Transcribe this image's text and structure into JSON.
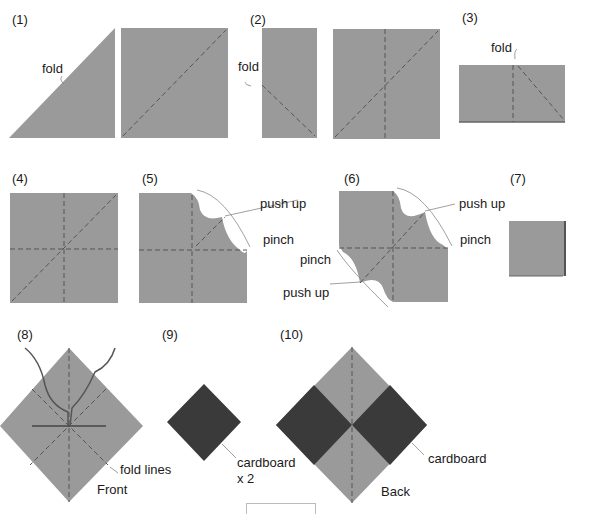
{
  "colors": {
    "paper": "#9a9a9a",
    "cardboard": "#3a3a3a",
    "fold_line": "#555555",
    "leader": "#888888",
    "text": "#1a1a1a"
  },
  "steps": [
    {
      "number": "(1)",
      "labels": [
        "fold"
      ]
    },
    {
      "number": "(2)",
      "labels": [
        "fold"
      ]
    },
    {
      "number": "(3)",
      "labels": [
        "fold"
      ]
    },
    {
      "number": "(4)",
      "labels": []
    },
    {
      "number": "(5)",
      "labels": [
        "push up",
        "pinch"
      ]
    },
    {
      "number": "(6)",
      "labels": [
        "push up",
        "pinch",
        "pinch",
        "push up"
      ]
    },
    {
      "number": "(7)",
      "labels": []
    },
    {
      "number": "(8)",
      "labels": [
        "fold lines",
        "Front"
      ]
    },
    {
      "number": "(9)",
      "labels": [
        "cardboard",
        "x 2"
      ]
    },
    {
      "number": "(10)",
      "labels": [
        "cardboard",
        "Back"
      ]
    }
  ]
}
